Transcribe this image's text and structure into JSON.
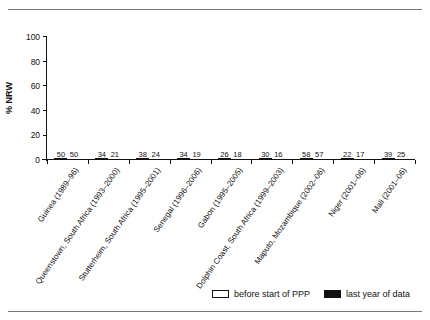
{
  "chart_data": {
    "type": "bar",
    "title": "",
    "xlabel": "",
    "ylabel": "% NRW",
    "ylim": [
      0,
      100
    ],
    "yticks": [
      0,
      20,
      40,
      60,
      80,
      100
    ],
    "grid": false,
    "legend_position": "bottom-right",
    "categories": [
      "Guinea (1989–96)",
      "Queenstown, South Africa (1993–2000)",
      "Stutterheim, South Africa (1995–2001)",
      "Senegal (1996–2006)",
      "Gabon (1995–2005)",
      "Dolphin Coast, South Africa (1999–2003)",
      "Maputo, Mozambique (2002–06)",
      "Niger (2001–06)",
      "Mali (2001–06)"
    ],
    "series": [
      {
        "name": "before start of PPP",
        "values": [
          50,
          34,
          38,
          34,
          26,
          30,
          58,
          22,
          39
        ],
        "drawn_heights": [
          67,
          46,
          51,
          46,
          35,
          40,
          78,
          30,
          53
        ],
        "color": "#ffffff"
      },
      {
        "name": "last year of data",
        "values": [
          50,
          21,
          24,
          19,
          18,
          16,
          57,
          17,
          25
        ],
        "drawn_heights": [
          67,
          29,
          33,
          26,
          24,
          22,
          77,
          23,
          34
        ],
        "color": "#111111"
      }
    ]
  },
  "legend": {
    "items": [
      {
        "label": "before start of PPP",
        "swatch": "white"
      },
      {
        "label": "last year of data",
        "swatch": "black"
      }
    ]
  },
  "axis": {
    "y_label": "% NRW",
    "y_ticks": [
      "100",
      "80",
      "60",
      "40",
      "20",
      "0"
    ]
  }
}
